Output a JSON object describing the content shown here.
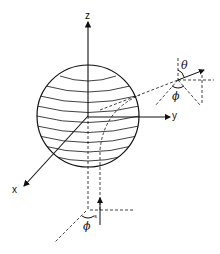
{
  "figure": {
    "type": "3d-coordinate-diagram",
    "axes": {
      "z": "z",
      "y": "y",
      "x": "x"
    },
    "angles": {
      "upper_theta": "θ",
      "upper_phi": "ϕ",
      "lower_phi": "ϕ",
      "lower_small": "s"
    },
    "colors": {
      "line": "#111111",
      "background": "#ffffff"
    }
  }
}
